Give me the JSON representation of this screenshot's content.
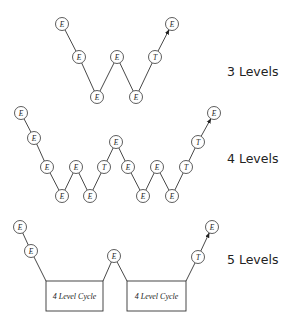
{
  "labels": {
    "level3": "3 Levels",
    "level4": "4 Levels",
    "level5": "5 Levels"
  },
  "boxes": {
    "box1": "4 Level Cycle",
    "box2": "4 Level Cycle"
  },
  "diagrams": [
    {
      "name": "3-levels",
      "nodes": [
        {
          "x": 62,
          "y": 24,
          "label": "E"
        },
        {
          "x": 79,
          "y": 57,
          "label": "E"
        },
        {
          "x": 97,
          "y": 97,
          "label": "E"
        },
        {
          "x": 117,
          "y": 57,
          "label": "E"
        },
        {
          "x": 136,
          "y": 97,
          "label": "E"
        },
        {
          "x": 155,
          "y": 57,
          "label": "T"
        },
        {
          "x": 172,
          "y": 24,
          "label": "E"
        }
      ]
    },
    {
      "name": "4-levels",
      "nodes": [
        {
          "x": 21,
          "y": 113,
          "label": "E"
        },
        {
          "x": 34,
          "y": 138,
          "label": "E"
        },
        {
          "x": 47,
          "y": 167,
          "label": "E"
        },
        {
          "x": 62,
          "y": 196,
          "label": "E"
        },
        {
          "x": 76,
          "y": 167,
          "label": "E"
        },
        {
          "x": 90,
          "y": 196,
          "label": "E"
        },
        {
          "x": 104,
          "y": 167,
          "label": "T"
        },
        {
          "x": 116,
          "y": 142,
          "label": "E"
        },
        {
          "x": 128,
          "y": 167,
          "label": "E"
        },
        {
          "x": 143,
          "y": 196,
          "label": "E"
        },
        {
          "x": 157,
          "y": 167,
          "label": "E"
        },
        {
          "x": 172,
          "y": 196,
          "label": "E"
        },
        {
          "x": 186,
          "y": 167,
          "label": "T"
        },
        {
          "x": 198,
          "y": 142,
          "label": "T"
        },
        {
          "x": 214,
          "y": 113,
          "label": "E"
        }
      ]
    },
    {
      "name": "5-levels",
      "nodes": [
        {
          "x": 20,
          "y": 227,
          "label": "E"
        },
        {
          "x": 31,
          "y": 251,
          "label": "E"
        },
        {
          "x": 114,
          "y": 256,
          "label": "E"
        },
        {
          "x": 198,
          "y": 257,
          "label": "T"
        },
        {
          "x": 212,
          "y": 227,
          "label": "E"
        }
      ]
    }
  ]
}
